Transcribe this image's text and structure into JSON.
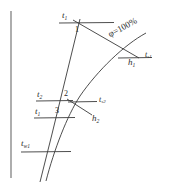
{
  "figure": {
    "type": "psychrometric-process-diagram",
    "background_color": "#ffffff",
    "line_color": "#2b2b2b",
    "axis": {
      "name": "vertical-axis-line",
      "x": 11,
      "y_top": 11,
      "y_bottom": 178
    },
    "saturation_curve": {
      "label": "φ=100%",
      "label_x": 112,
      "label_y": 30,
      "label_rotation": -27,
      "font_size": 9
    },
    "state_points": [
      {
        "id": "point-1",
        "label": "1",
        "x": 77,
        "y": 30,
        "font_size": 8
      },
      {
        "id": "point-2",
        "label": "2",
        "x": 65,
        "y": 94,
        "font_size": 8
      },
      {
        "id": "point-3",
        "label": "3",
        "x": 56,
        "y": 112,
        "font_size": 8
      }
    ],
    "labels": [
      {
        "id": "label-t1-top",
        "text": "t",
        "sub": "1",
        "x": 62,
        "y": 14,
        "font_size": 9
      },
      {
        "id": "label-phi",
        "text": "φ=100%",
        "x": 112,
        "y": 30,
        "font_size": 9
      },
      {
        "id": "label-h1",
        "text": "h",
        "sub": "1",
        "x": 129,
        "y": 61,
        "font_size": 9
      },
      {
        "id": "label-ts1",
        "text": "t",
        "sub": "s1",
        "x": 145,
        "y": 55,
        "font_size": 8
      },
      {
        "id": "label-t2",
        "text": "t",
        "sub": "2",
        "x": 38,
        "y": 93,
        "font_size": 9
      },
      {
        "id": "label-ts2",
        "text": "t",
        "sub": "s2",
        "x": 94,
        "y": 100,
        "font_size": 8
      },
      {
        "id": "label-t1-mid",
        "text": "t",
        "sub": "1",
        "x": 36,
        "y": 110,
        "font_size": 9
      },
      {
        "id": "label-h2",
        "text": "h",
        "sub": "2",
        "x": 91,
        "y": 117,
        "font_size": 9
      },
      {
        "id": "label-tw1",
        "text": "t",
        "sub": "w1",
        "x": 22,
        "y": 138,
        "font_size": 9
      }
    ],
    "lines": {
      "isotherm_t1_top": {
        "name": "isotherm-line-t1-top",
        "x1": 60,
        "y1": 23,
        "x2": 114,
        "y2": 23
      },
      "isotherm_t2": {
        "name": "isotherm-line-t2",
        "x1": 37,
        "y1": 101,
        "x2": 72,
        "y2": 101
      },
      "isotherm_t1_mid": {
        "name": "isotherm-line-t1-mid",
        "x1": 35,
        "y1": 118,
        "x2": 74,
        "y2": 118
      },
      "isotherm_tw1": {
        "name": "isotherm-line-tw1",
        "x1": 22,
        "y1": 152,
        "x2": 70,
        "y2": 152
      },
      "enthalpy_h1": {
        "name": "enthalpy-line-h1",
        "x1": 119,
        "y1": 58,
        "x2": 151,
        "y2": 58
      },
      "enthalpy_h2": {
        "name": "enthalpy-line-h2",
        "x1": 72,
        "y1": 102,
        "x2": 96,
        "y2": 102
      },
      "process_1_to_h1": {
        "name": "process-line-1-to-h1",
        "x1": 74,
        "y1": 22,
        "x2": 137,
        "y2": 57
      },
      "process_h2_slant": {
        "name": "process-line-h2-slant",
        "x1": 70,
        "y1": 100,
        "x2": 92,
        "y2": 114
      },
      "process_1_to_3": {
        "name": "process-line-1-to-3",
        "x1": 79,
        "y1": 24,
        "x2": 57,
        "y2": 118
      }
    },
    "curve_path": "M 140 37 C 120 48, 95 72, 78 96 C 66 114, 54 148, 47 180",
    "curve_name": "saturation-curve-phi-100"
  }
}
